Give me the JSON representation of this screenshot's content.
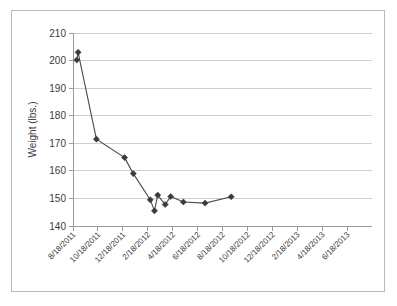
{
  "figure": {
    "background_color": "#ffffff",
    "frame_color": "#b9b9b9",
    "plot_area": {
      "left": 73,
      "top": 33,
      "right": 372,
      "bottom": 226
    }
  },
  "chart_data": {
    "type": "line",
    "title": "",
    "xlabel": "",
    "ylabel": "Weight (lbs.)",
    "ylim": [
      140,
      210
    ],
    "ytick_labels": [
      "140",
      "150",
      "160",
      "170",
      "180",
      "190",
      "200",
      "210"
    ],
    "ytick_values": [
      140,
      150,
      160,
      170,
      180,
      190,
      200,
      210
    ],
    "grid": true,
    "grid_axis": "y",
    "legend": false,
    "marker": "diamond",
    "marker_color": "#3a3a3a",
    "line_color": "#4a4a4a",
    "xtick_labels": [
      "8/18/2011",
      "10/18/2011",
      "12/18/2011",
      "2/18/2012",
      "4/18/2012",
      "6/18/2012",
      "8/18/2012",
      "10/18/2012",
      "12/18/2012",
      "2/18/2013",
      "4/18/2013",
      "6/18/2013"
    ],
    "xtick_rotation": -45,
    "x_dates": [
      "8/18/2011",
      "9/5/2011",
      "3/15/2012",
      "6/22/2012",
      "7/25/2012",
      "9/24/2012",
      "10/8/2012",
      "10/20/2012",
      "11/15/2012",
      "12/5/2012",
      "1/20/2013",
      "4/5/2013",
      "7/10/2013"
    ],
    "x_positions": [
      0.0,
      0.055,
      0.79,
      1.92,
      2.27,
      2.95,
      3.12,
      3.25,
      3.55,
      3.77,
      4.28,
      5.15,
      6.2
    ],
    "values": [
      200.2,
      203.0,
      171.5,
      164.8,
      159.0,
      149.5,
      145.5,
      151.2,
      147.8,
      150.7,
      148.7,
      148.3,
      150.6
    ],
    "series": [
      {
        "name": "Weight",
        "values": [
          200.2,
          203.0,
          171.5,
          164.8,
          159.0,
          149.5,
          145.5,
          151.2,
          147.8,
          150.7,
          148.7,
          148.3,
          150.6
        ]
      }
    ]
  }
}
